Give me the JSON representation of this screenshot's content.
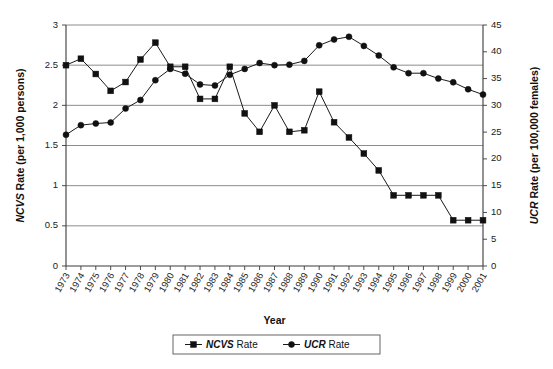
{
  "chart_data": {
    "type": "line",
    "title": "",
    "xlabel": "Year",
    "ylabel": "NCVS Rate (per 1,000 persons)",
    "y2label": "UCR Rate (per 100,000 females)",
    "ylim": [
      0,
      3
    ],
    "y2lim": [
      0,
      45
    ],
    "yticks": [
      "0",
      "0.5",
      "1",
      "1.5",
      "2",
      "2.5",
      "3"
    ],
    "y2ticks": [
      "0",
      "5",
      "10",
      "15",
      "20",
      "25",
      "30",
      "35",
      "40",
      "45"
    ],
    "grid": true,
    "legend_position": "bottom-center",
    "categories": [
      "1973",
      "1974",
      "1975",
      "1976",
      "1977",
      "1978",
      "1979",
      "1980",
      "1981",
      "1982",
      "1983",
      "1984",
      "1985",
      "1986",
      "1987",
      "1988",
      "1989",
      "1990",
      "1991",
      "1992",
      "1993",
      "1994",
      "1995",
      "1996",
      "1997",
      "1998",
      "1999",
      "2000",
      "2001"
    ],
    "series": [
      {
        "name": "NCVS Rate",
        "marker": "square",
        "axis": "left",
        "units": "per 1,000 persons",
        "values": [
          2.5,
          2.58,
          2.39,
          2.18,
          2.29,
          2.57,
          2.78,
          2.48,
          2.48,
          2.08,
          2.08,
          2.48,
          1.9,
          1.67,
          2.0,
          1.67,
          1.69,
          2.17,
          1.79,
          1.6,
          1.4,
          1.19,
          0.88,
          0.88,
          0.88,
          0.88,
          0.57,
          0.57,
          0.57
        ]
      },
      {
        "name": "UCR Rate",
        "marker": "circle",
        "axis": "right",
        "units": "per 100,000 females",
        "values": [
          24.5,
          26.3,
          26.6,
          26.8,
          29.4,
          31.0,
          34.7,
          36.8,
          35.9,
          33.9,
          33.7,
          35.7,
          36.8,
          37.9,
          37.5,
          37.6,
          38.3,
          41.2,
          42.3,
          42.8,
          41.1,
          39.3,
          37.1,
          36.0,
          36.0,
          35.0,
          34.3,
          33.0,
          32.0
        ]
      }
    ]
  },
  "legend": {
    "items": [
      {
        "acronym": "NCVS",
        "suffix": " Rate",
        "marker": "square"
      },
      {
        "acronym": "UCR",
        "suffix": " Rate",
        "marker": "circle"
      }
    ]
  },
  "axes": {
    "y_left_title_italic": "NCVS",
    "y_left_title_rest": " Rate (per 1,000 persons)",
    "y_right_title_italic": "UCR",
    "y_right_title_rest": " Rate (per 100,000 females)",
    "x_title": "Year"
  }
}
